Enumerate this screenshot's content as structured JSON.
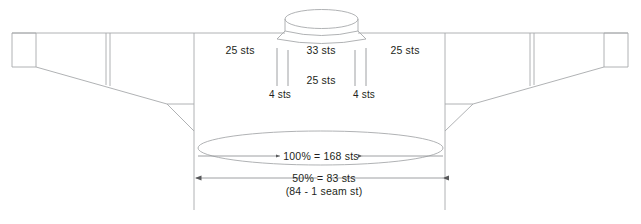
{
  "diagram": {
    "type": "knitting-schematic",
    "colors": {
      "outline": "#a7a9ac",
      "text": "#231f20",
      "dimension_line": "#939598",
      "background": "#ffffff"
    },
    "labels": {
      "left_shoulder": "25 sts",
      "neck_front": "33 sts",
      "neck_back": "25 sts",
      "right_shoulder": "25 sts",
      "left_neck_edge": "4 sts",
      "right_neck_edge": "4 sts",
      "hem_full": "100% = 168 sts",
      "hem_half": "50% = 83 sts",
      "hem_half_note": "(84 - 1 seam st)"
    },
    "measurements": {
      "total_stitches": 168,
      "half_stitches": 83,
      "half_stitches_before_seam": 84,
      "seam_stitches": 1,
      "shoulder_stitches": 25,
      "neck_front_stitches": 33,
      "neck_back_stitches": 25,
      "neck_edge_stitches": 4
    }
  }
}
